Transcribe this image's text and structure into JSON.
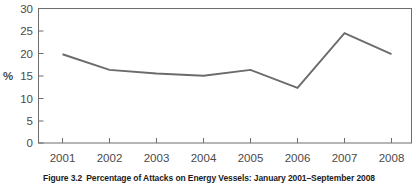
{
  "figure": {
    "caption_number": "Figure 3.2",
    "caption_text": "Percentage of Attacks on Energy Vessels: January 2001–September 2008"
  },
  "chart_data": {
    "type": "line",
    "title": "",
    "subtitle": "",
    "xlabel": "",
    "ylabel": "%",
    "categories": [
      "2001",
      "2002",
      "2003",
      "2004",
      "2005",
      "2006",
      "2007",
      "2008"
    ],
    "values": [
      19.8,
      16.3,
      15.5,
      15.0,
      16.3,
      12.3,
      24.5,
      19.8
    ],
    "series": [
      {
        "name": "Percentage of attacks on energy vessels",
        "values": [
          19.8,
          16.3,
          15.5,
          15.0,
          16.3,
          12.3,
          24.5,
          19.8
        ],
        "color": "#6b6b6b"
      }
    ],
    "ylim": [
      0,
      30
    ],
    "ytick_labels": [
      "0",
      "5",
      "10",
      "15",
      "20",
      "25",
      "30"
    ],
    "ytick_values": [
      0,
      5,
      10,
      15,
      20,
      25,
      30
    ],
    "xtick_labels": [
      "2001",
      "2002",
      "2003",
      "2004",
      "2005",
      "2006",
      "2007",
      "2008"
    ],
    "grid": false,
    "legend": "none",
    "frame": "box",
    "line_color": "#6b6b6b",
    "axis_color": "#6d6d6d",
    "text_color": "#4a4a4a"
  }
}
